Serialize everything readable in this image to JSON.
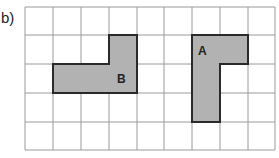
{
  "label": "b)",
  "grid": {
    "cols": 9,
    "rows": 5,
    "x_lines": [
      25,
      53,
      81,
      109,
      137,
      164,
      192,
      220,
      248,
      275
    ],
    "y_lines": [
      7,
      35,
      64,
      93,
      122,
      150
    ],
    "line_color": "#9a9a9a"
  },
  "shapes": [
    {
      "name": "B",
      "fill": "#b2b2b2",
      "stroke": "#2a2a2a",
      "cells": [
        [
          3,
          1
        ],
        [
          1,
          2
        ],
        [
          2,
          2
        ],
        [
          3,
          2
        ]
      ],
      "polygon": "109,35 137,35 137,93 53,93 53,64 109,64",
      "label_pos": [
        117,
        83
      ]
    },
    {
      "name": "A",
      "fill": "#b2b2b2",
      "stroke": "#2a2a2a",
      "cells": [
        [
          6,
          1
        ],
        [
          7,
          1
        ],
        [
          6,
          2
        ],
        [
          6,
          3
        ]
      ],
      "polygon": "192,35 248,35 248,64 220,64 220,122 192,122",
      "label_pos": [
        198,
        55
      ]
    }
  ]
}
